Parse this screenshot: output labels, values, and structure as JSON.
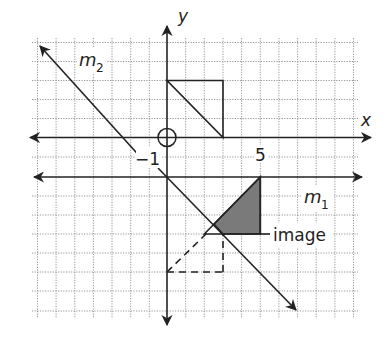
{
  "figure": {
    "type": "coordinate-plane-reflection",
    "axes": {
      "x_label": "x",
      "y_label": "y",
      "x_range": [
        -7,
        10
      ],
      "y_range": [
        -9,
        5
      ],
      "tick_labels": [
        {
          "text": "−1",
          "at": "x = -1"
        },
        {
          "text": "5",
          "at": "x = 5"
        }
      ]
    },
    "lines": [
      {
        "name": "m1",
        "label": "m",
        "subscript": "1",
        "equation": "y = -2"
      },
      {
        "name": "m2",
        "label": "m",
        "subscript": "2",
        "equation": "y = -x - 2"
      }
    ],
    "original_triangle": {
      "vertices": [
        [
          0,
          3
        ],
        [
          3,
          3
        ],
        [
          3,
          0
        ]
      ]
    },
    "intermediate_triangle_dashed": {
      "vertices": [
        [
          0,
          -7
        ],
        [
          3,
          -7
        ],
        [
          3,
          -5
        ]
      ]
    },
    "image_triangle": {
      "label": "image",
      "vertices": [
        [
          2,
          -5
        ],
        [
          5,
          -5
        ],
        [
          5,
          -2
        ]
      ],
      "fill": "#7a7a7a"
    },
    "origin_marker": "circle-crosshair"
  },
  "labels": {
    "x": "x",
    "y": "y",
    "m": "m",
    "sub1": "1",
    "sub2": "2",
    "neg1": "−1",
    "five": "5",
    "image": "image"
  }
}
